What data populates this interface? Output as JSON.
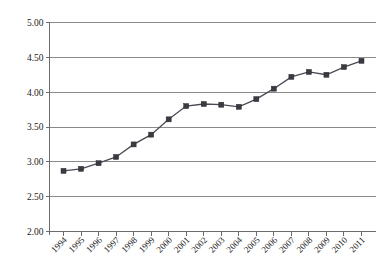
{
  "chart_data": {
    "type": "line",
    "title": "",
    "subtitle": "",
    "xlabel": "",
    "ylabel": "",
    "categories": [
      "1994",
      "1995",
      "1996",
      "1997",
      "1998",
      "1999",
      "2000",
      "2001",
      "2002",
      "2003",
      "2004",
      "2005",
      "2006",
      "2007",
      "2008",
      "2009",
      "2010",
      "2011"
    ],
    "series": [
      {
        "name": "",
        "values": [
          2.87,
          2.9,
          2.98,
          3.07,
          3.25,
          3.39,
          3.61,
          3.8,
          3.83,
          3.82,
          3.79,
          3.9,
          4.05,
          4.22,
          4.29,
          4.25,
          4.36,
          4.45
        ]
      }
    ],
    "ylim": [
      2.0,
      5.0
    ],
    "ytick_values": [
      5.0,
      4.5,
      4.0,
      3.5,
      3.0,
      2.5,
      2.0
    ],
    "ytick_labels": [
      "5.00",
      "4.50",
      "4.00",
      "3.50",
      "3.00",
      "2.50",
      "2.00"
    ],
    "xtick_labels": [
      "1994",
      "1995",
      "1996",
      "1997",
      "1998",
      "1999",
      "2000",
      "2001",
      "2002",
      "2003",
      "2004",
      "2005",
      "2006",
      "2007",
      "2008",
      "2009",
      "2010",
      "2011"
    ],
    "grid": true,
    "grid_axis": "y",
    "legend": false,
    "legend_position": "none",
    "marker": "square",
    "colors": {
      "line": "#4a4a52",
      "marker": "#3a3a42",
      "grid": "#8a8a8a",
      "axis": "#6b6b6b",
      "text": "#222222",
      "background": "#ffffff"
    }
  }
}
